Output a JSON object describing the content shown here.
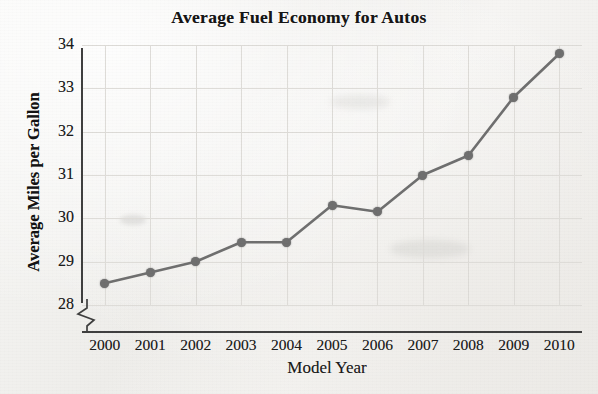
{
  "chart_data": {
    "type": "line",
    "title": "Average Fuel Economy for Autos",
    "xlabel": "Model Year",
    "ylabel": "Average Miles per Gallon",
    "categories": [
      "2000",
      "2001",
      "2002",
      "2003",
      "2004",
      "2005",
      "2006",
      "2007",
      "2008",
      "2009",
      "2010"
    ],
    "values": [
      28.5,
      28.75,
      29.0,
      29.45,
      29.45,
      30.3,
      30.15,
      31.0,
      31.45,
      32.8,
      33.8
    ],
    "series": [
      {
        "name": "Average Miles per Gallon",
        "values": [
          28.5,
          28.75,
          29.0,
          29.45,
          29.45,
          30.3,
          30.15,
          31.0,
          31.45,
          32.8,
          33.8
        ]
      }
    ],
    "y_ticks": [
      28,
      29,
      30,
      31,
      32,
      33,
      34
    ],
    "ylim": [
      28,
      34
    ],
    "xlim": [
      "2000",
      "2010"
    ],
    "y_axis_break": true,
    "grid": true,
    "legend": "none",
    "line_color": "#6f6f6f",
    "marker_color": "#6f6f6f",
    "grid_color": "#dedcd8",
    "axis_color": "#3f3f3f",
    "background_color": "#f2f2f0"
  }
}
